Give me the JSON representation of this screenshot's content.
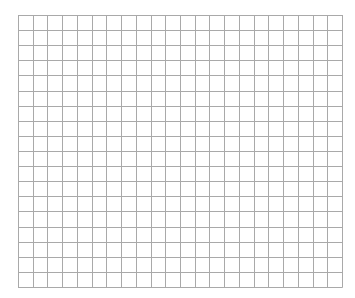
{
  "grid": {
    "columns": 22,
    "rows": 18,
    "left": 18,
    "top": 15,
    "width": 324,
    "height": 272,
    "line_color": "#a9a9a9",
    "background": "#ffffff"
  }
}
